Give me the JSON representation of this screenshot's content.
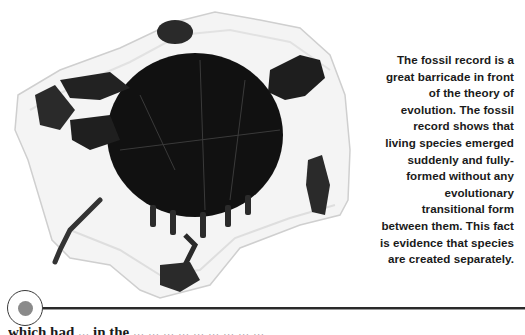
{
  "figure": {
    "alt": "Fossilized turtle with shell, limbs, head and tail embedded in a light rock slab"
  },
  "caption": {
    "text": "The fossil record is a great barricade in front of the theory of evolution. The fossil record shows that living species emerged suddenly and fully-formed without any evolutionary transitional form between them. This fact is evidence that species are created separately.",
    "lines": [
      "The fossil record is a",
      "great barricade in front",
      "of the theory of",
      "evolution. The fossil",
      "record shows that",
      "living species emerged",
      "suddenly and fully-",
      "formed without any",
      "evolutionary",
      "transitional form",
      "between them. This fact",
      "is evidence that species",
      "are created separately."
    ]
  },
  "divider": {
    "marker_icon": "circle-bullet-icon",
    "ring_color": "#3a3a3a",
    "dot_color": "#8a8a8a",
    "rule_color": "#2a2a2a"
  },
  "body": {
    "partial_line": "which had ... in the ... ... ... ... ... ... ... ... ..."
  }
}
